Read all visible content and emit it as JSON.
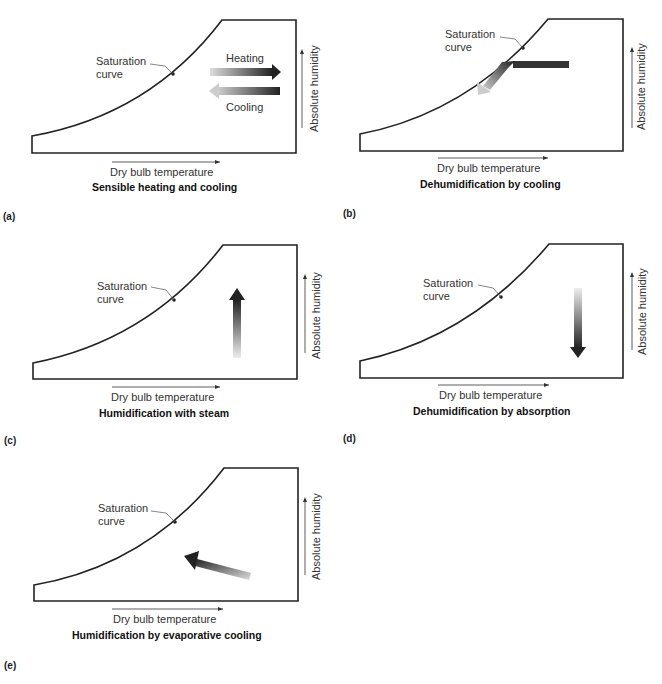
{
  "figure": {
    "common": {
      "saturation_label_line1": "Saturation",
      "saturation_label_line2": "curve",
      "x_axis_label": "Dry bulb temperature",
      "y_axis_label": "Absolute humidity"
    },
    "panels": [
      {
        "id": "a",
        "tag": "(a)",
        "caption": "Sensible heating and cooling",
        "arrows": [
          {
            "label": "Heating",
            "direction": "right"
          },
          {
            "label": "Cooling",
            "direction": "left"
          }
        ]
      },
      {
        "id": "b",
        "tag": "(b)",
        "caption": "Dehumidification by cooling",
        "arrows": [
          {
            "direction": "left-then-down-along-curve"
          }
        ]
      },
      {
        "id": "c",
        "tag": "(c)",
        "caption": "Humidification with steam",
        "arrows": [
          {
            "direction": "up"
          }
        ]
      },
      {
        "id": "d",
        "tag": "(d)",
        "caption": "Dehumidification by absorption",
        "arrows": [
          {
            "direction": "down"
          }
        ]
      },
      {
        "id": "e",
        "tag": "(e)",
        "caption": "Humidification by evaporative cooling",
        "arrows": [
          {
            "direction": "up-left"
          }
        ]
      }
    ]
  }
}
